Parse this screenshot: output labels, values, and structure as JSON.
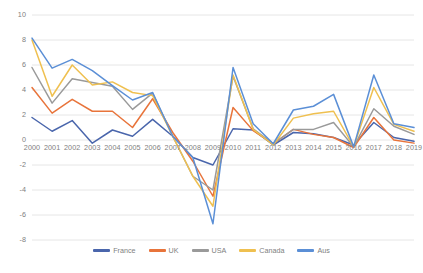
{
  "chart_data": {
    "type": "line",
    "title": "",
    "subtitle": "",
    "xlabel": "",
    "ylabel": "",
    "categories": [
      "2000",
      "2001",
      "2002",
      "2003",
      "2004",
      "2005",
      "2006",
      "2007",
      "2008",
      "2009",
      "2010",
      "2011",
      "2012",
      "2013",
      "2014",
      "2015",
      "2016",
      "2017",
      "2018",
      "2019"
    ],
    "ylim": [
      -8,
      10
    ],
    "yticks": [
      10,
      8,
      6,
      4,
      2,
      0,
      -2,
      -4,
      -6,
      -8
    ],
    "grid": true,
    "legend_position": "bottom",
    "series": [
      {
        "name": "France",
        "color": "#4A66AC",
        "values": [
          1.8,
          0.7,
          1.55,
          -0.25,
          0.8,
          0.3,
          1.65,
          0.3,
          -1.4,
          -2.0,
          0.9,
          0.8,
          -0.4,
          0.6,
          0.5,
          0.2,
          -0.4,
          1.4,
          0.2,
          -0.1
        ]
      },
      {
        "name": "UK",
        "color": "#E8743B",
        "values": [
          4.2,
          2.15,
          3.25,
          2.3,
          2.3,
          1.0,
          3.3,
          0.6,
          -1.7,
          -4.5,
          2.6,
          0.75,
          -0.3,
          0.85,
          0.45,
          0.2,
          -0.6,
          1.8,
          0.0,
          -0.25
        ]
      },
      {
        "name": "USA",
        "color": "#9A9A9A",
        "values": [
          5.8,
          2.95,
          4.9,
          4.6,
          4.3,
          2.45,
          3.75,
          0.3,
          -2.9,
          -4.0,
          5.1,
          0.9,
          -0.3,
          0.85,
          0.85,
          1.4,
          -0.55,
          2.5,
          1.1,
          0.45
        ]
      },
      {
        "name": "Canada",
        "color": "#EFC050",
        "values": [
          8.0,
          3.5,
          6.0,
          4.4,
          4.65,
          3.8,
          3.55,
          0.3,
          -2.9,
          -5.3,
          5.2,
          0.85,
          -0.4,
          1.75,
          2.1,
          2.3,
          -0.55,
          4.2,
          1.25,
          0.7
        ]
      },
      {
        "name": "Aus",
        "color": "#5B8FD6",
        "values": [
          8.15,
          5.75,
          6.45,
          5.55,
          4.35,
          3.2,
          3.8,
          0.3,
          -1.4,
          -6.7,
          5.8,
          1.3,
          -0.3,
          2.4,
          2.7,
          3.65,
          -0.55,
          5.2,
          1.3,
          1.0
        ]
      }
    ]
  },
  "axis": {
    "y_labels": [
      "10",
      "8",
      "6",
      "4",
      "2",
      "0",
      "-2",
      "-4",
      "-6",
      "-8"
    ],
    "x_labels": [
      "2000",
      "2001",
      "2002",
      "2003",
      "2004",
      "2005",
      "2006",
      "2007",
      "2008",
      "2009",
      "2010",
      "2011",
      "2012",
      "2013",
      "2014",
      "2015",
      "2016",
      "2017",
      "2018",
      "2019"
    ]
  },
  "legend": {
    "items": [
      {
        "label": "France",
        "color": "#4A66AC"
      },
      {
        "label": "UK",
        "color": "#E8743B"
      },
      {
        "label": "USA",
        "color": "#9A9A9A"
      },
      {
        "label": "Canada",
        "color": "#EFC050"
      },
      {
        "label": "Aus",
        "color": "#5B8FD6"
      }
    ]
  },
  "style": {
    "background": "#FFFFFF",
    "gridline_color": "#E6E6E6",
    "tick_text_color": "#808080"
  }
}
